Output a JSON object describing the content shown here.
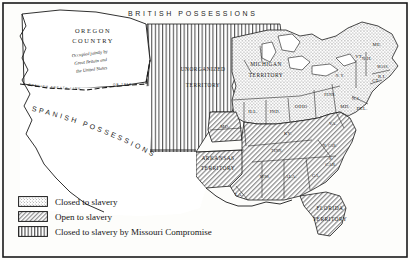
{
  "map": {
    "frame_color": "#1a1a1a",
    "background": "#fdfdfb",
    "regions": {
      "british": "BRITISH  POSSESSIONS",
      "spanish": "SPANISH POSSESSIONS",
      "oregon_name": "OREGON",
      "oregon_name2": "COUNTRY",
      "oregon_note1": "Occupied jointly by",
      "oregon_note2": "Great Britain and",
      "oregon_note3": "the United States",
      "treaty_line": "SPANISH  TREATY  LINE",
      "treaty_year": "OF 1819",
      "unorganized1": "UNORGANIZED",
      "unorganized2": "TERRITORY",
      "michigan1": "MICHIGAN",
      "michigan2": "TERRITORY",
      "arkansas1": "ARKANSAS",
      "arkansas2": "TERRITORY",
      "florida1": "FLORIDA",
      "florida2": "TERRITORY"
    },
    "states": [
      {
        "id": "ill",
        "label": "ILL.",
        "x": 253,
        "y": 113,
        "fill": "dots"
      },
      {
        "id": "ind",
        "label": "IND.",
        "x": 275,
        "y": 113,
        "fill": "dots"
      },
      {
        "id": "ohio",
        "label": "OHIO",
        "x": 301,
        "y": 108,
        "fill": "dots"
      },
      {
        "id": "penn",
        "label": "PENN.",
        "x": 330,
        "y": 96,
        "fill": "dots"
      },
      {
        "id": "ny",
        "label": "N. Y.",
        "x": 340,
        "y": 77,
        "fill": "dots"
      },
      {
        "id": "me",
        "label": "ME.",
        "x": 377,
        "y": 46,
        "fill": "dots"
      },
      {
        "id": "vt",
        "label": "VT.",
        "x": 359,
        "y": 58,
        "fill": "dots"
      },
      {
        "id": "nh",
        "label": "N.H.",
        "x": 367,
        "y": 60,
        "fill": "dots"
      },
      {
        "id": "mass",
        "label": "MASS.",
        "x": 383,
        "y": 68,
        "fill": "dots"
      },
      {
        "id": "ri",
        "label": "R.I.",
        "x": 382,
        "y": 78,
        "fill": "dots"
      },
      {
        "id": "conn",
        "label": "CT.",
        "x": 376,
        "y": 82,
        "fill": "dots"
      },
      {
        "id": "nj",
        "label": "N.J.",
        "x": 356,
        "y": 100,
        "fill": "dots"
      },
      {
        "id": "del",
        "label": "DEL.",
        "x": 362,
        "y": 110,
        "fill": "dots"
      },
      {
        "id": "md",
        "label": "MD.",
        "x": 345,
        "y": 108,
        "fill": "hatch"
      },
      {
        "id": "va",
        "label": "VA.",
        "x": 333,
        "y": 125,
        "fill": "hatch"
      },
      {
        "id": "ky",
        "label": "KY.",
        "x": 288,
        "y": 135,
        "fill": "hatch"
      },
      {
        "id": "tenn",
        "label": "TENN.",
        "x": 277,
        "y": 152,
        "fill": "hatch"
      },
      {
        "id": "ncar",
        "label": "N. CAR.",
        "x": 330,
        "y": 147,
        "fill": "hatch"
      },
      {
        "id": "scar1",
        "label": "S.",
        "x": 331,
        "y": 160,
        "fill": "hatch"
      },
      {
        "id": "scar2",
        "label": "CAR.",
        "x": 331,
        "y": 166,
        "fill": "hatch"
      },
      {
        "id": "ga",
        "label": "GA.",
        "x": 316,
        "y": 177,
        "fill": "hatch"
      },
      {
        "id": "ala",
        "label": "ALA.",
        "x": 291,
        "y": 178,
        "fill": "hatch"
      },
      {
        "id": "miss",
        "label": "MISS.",
        "x": 265,
        "y": 178,
        "fill": "hatch"
      },
      {
        "id": "la",
        "label": "LA.",
        "x": 239,
        "y": 196,
        "fill": "hatch"
      },
      {
        "id": "mo",
        "label": "MO.",
        "x": 225,
        "y": 128,
        "fill": "hatch"
      }
    ]
  },
  "legend": {
    "items": [
      {
        "pattern": "dots",
        "label": "Closed to slavery"
      },
      {
        "pattern": "hatch",
        "label": "Open to slavery"
      },
      {
        "pattern": "stripes",
        "label": "Closed to slavery by Missouri Compromise"
      }
    ]
  }
}
